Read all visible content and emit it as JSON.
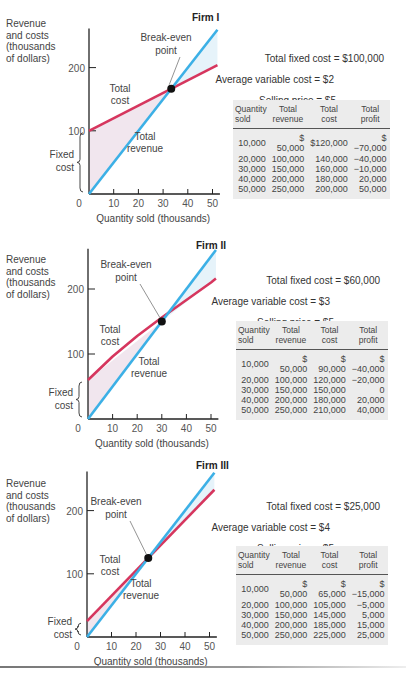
{
  "chart_data": [
    {
      "type": "line",
      "title": "Firm I",
      "xlabel": "Quantity sold (thousands)",
      "ylabel": "Revenue and costs (thousands of dollars)",
      "x_ticks": [
        0,
        10,
        20,
        30,
        40,
        50
      ],
      "y_ticks": [
        100,
        200
      ],
      "xlim": [
        0,
        52
      ],
      "ylim": [
        0,
        250
      ],
      "series": [
        {
          "name": "Total cost",
          "color": "#d6365e",
          "x": [
            0,
            52
          ],
          "values": [
            100,
            204
          ]
        },
        {
          "name": "Total revenue",
          "color": "#3cb0e6",
          "x": [
            0,
            52
          ],
          "values": [
            0,
            260
          ]
        }
      ],
      "annotations": {
        "break_even": {
          "label": "Break-even point",
          "x": 33.3,
          "y": 166.7
        },
        "fixed_cost": {
          "label": "Fixed cost",
          "from": 0,
          "to": 100
        },
        "total_cost_label": "Total cost",
        "total_revenue_label": "Total revenue"
      }
    },
    {
      "type": "line",
      "title": "Firm II",
      "xlabel": "Quantity sold (thousands)",
      "ylabel": "Revenue and costs (thousands of dollars)",
      "x_ticks": [
        0,
        10,
        20,
        30,
        40,
        50
      ],
      "y_ticks": [
        100,
        200
      ],
      "xlim": [
        0,
        52
      ],
      "ylim": [
        0,
        250
      ],
      "series": [
        {
          "name": "Total cost",
          "color": "#d6365e",
          "x": [
            0,
            10,
            20,
            30,
            40,
            50,
            52
          ],
          "values": [
            60,
            90,
            120,
            150,
            180,
            210,
            216
          ]
        },
        {
          "name": "Total revenue",
          "color": "#3cb0e6",
          "x": [
            0,
            52
          ],
          "values": [
            0,
            260
          ]
        }
      ],
      "annotations": {
        "break_even": {
          "label": "Break-even point",
          "x": 30,
          "y": 150
        },
        "fixed_cost": {
          "label": "Fixed cost",
          "from": 0,
          "to": 60
        },
        "total_cost_label": "Total cost",
        "total_revenue_label": "Total revenue"
      }
    },
    {
      "type": "line",
      "title": "Firm III",
      "xlabel": "Quantity sold (thousands)",
      "ylabel": "Revenue and costs (thousands of dollars)",
      "x_ticks": [
        0,
        10,
        20,
        30,
        40,
        50
      ],
      "y_ticks": [
        100,
        200
      ],
      "xlim": [
        0,
        52
      ],
      "ylim": [
        0,
        250
      ],
      "series": [
        {
          "name": "Total cost",
          "color": "#d6365e",
          "x": [
            0,
            52
          ],
          "values": [
            25,
            233
          ]
        },
        {
          "name": "Total revenue",
          "color": "#3cb0e6",
          "x": [
            0,
            52
          ],
          "values": [
            0,
            260
          ]
        }
      ],
      "annotations": {
        "break_even": {
          "label": "Break-even point",
          "x": 25,
          "y": 125
        },
        "fixed_cost": {
          "label": "Fixed cost",
          "from": 0,
          "to": 25
        },
        "total_cost_label": "Total cost",
        "total_revenue_label": "Total revenue"
      }
    }
  ],
  "labels": {
    "ylabel_lines": [
      "Revenue",
      "and costs",
      "(thousands",
      "of dollars)"
    ],
    "xlabel": "Quantity sold (thousands)",
    "break_even_lines": [
      "Break-even",
      "point"
    ],
    "total_cost_lines": [
      "Total",
      "cost"
    ],
    "total_revenue_lines": [
      "Total",
      "revenue"
    ],
    "fixed_cost_lines": [
      "Fixed",
      "cost"
    ],
    "x_ticks": [
      "0",
      "10",
      "20",
      "30",
      "40",
      "50"
    ],
    "y_tick_100": "100",
    "y_tick_200": "200"
  },
  "firms": [
    {
      "title": "Firm I",
      "total_fixed_cost": "Total fixed cost = $100,000",
      "average_variable_cost": "Average variable cost = $2",
      "selling_price": "Selling price = $5",
      "table": {
        "headers": [
          [
            "Quantity",
            "sold"
          ],
          [
            "Total",
            "revenue"
          ],
          [
            "Total",
            "cost"
          ],
          [
            "Total",
            "profit"
          ]
        ],
        "rows": [
          [
            "10,000",
            "$ 50,000",
            "$120,000",
            "$−70,000"
          ],
          [
            "20,000",
            "100,000",
            "140,000",
            "−40,000"
          ],
          [
            "30,000",
            "150,000",
            "160,000",
            "−10,000"
          ],
          [
            "40,000",
            "200,000",
            "180,000",
            "20,000"
          ],
          [
            "50,000",
            "250,000",
            "200,000",
            "50,000"
          ]
        ]
      }
    },
    {
      "title": "Firm II",
      "total_fixed_cost": "Total fixed cost = $60,000",
      "average_variable_cost": "Average variable cost = $3",
      "selling_price": "Selling price = $5",
      "table": {
        "headers": [
          [
            "Quantity",
            "sold"
          ],
          [
            "Total",
            "revenue"
          ],
          [
            "Total",
            "cost"
          ],
          [
            "Total",
            "profit"
          ]
        ],
        "rows": [
          [
            "10,000",
            "$ 50,000",
            "$ 90,000",
            "$−40,000"
          ],
          [
            "20,000",
            "100,000",
            "120,000",
            "−20,000"
          ],
          [
            "30,000",
            "150,000",
            "150,000",
            "0"
          ],
          [
            "40,000",
            "200,000",
            "180,000",
            "20,000"
          ],
          [
            "50,000",
            "250,000",
            "210,000",
            "40,000"
          ]
        ]
      }
    },
    {
      "title": "Firm III",
      "total_fixed_cost": "Total fixed cost = $25,000",
      "average_variable_cost": "Average variable cost = $4",
      "selling_price": "Selling price = $5",
      "table": {
        "headers": [
          [
            "Quantity",
            "sold"
          ],
          [
            "Total",
            "revenue"
          ],
          [
            "Total",
            "cost"
          ],
          [
            "Total",
            "profit"
          ]
        ],
        "rows": [
          [
            "10,000",
            "$ 50,000",
            "$ 65,000",
            "$−15,000"
          ],
          [
            "20,000",
            "100,000",
            "105,000",
            "−5,000"
          ],
          [
            "30,000",
            "150,000",
            "145,000",
            "5,000"
          ],
          [
            "40,000",
            "200,000",
            "185,000",
            "15,000"
          ],
          [
            "50,000",
            "250,000",
            "225,000",
            "25,000"
          ]
        ]
      }
    }
  ]
}
